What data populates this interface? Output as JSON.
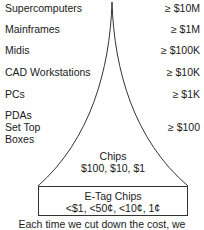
{
  "tiers": [
    {
      "name": "Supercomputers",
      "price": "≥ $10M"
    },
    {
      "name": "Mainframes",
      "price": "≥ $1M"
    },
    {
      "name": "Midis",
      "price": "≥ $100K"
    },
    {
      "name": "CAD Workstations",
      "price": "≥ $10K"
    },
    {
      "name": "PCs",
      "price": "≥ $1K"
    },
    {
      "name_lines": [
        "PDAs",
        "Set Top",
        "Boxes"
      ],
      "price": "≥ $100"
    }
  ],
  "chips": {
    "title": "Chips",
    "prices": "$100, $10, $1"
  },
  "etag": {
    "title": "E-Tag Chips",
    "prices": "<$1, <50¢, <10¢, 1¢"
  },
  "caption_lines": [
    "Each time we cut down the cost, we",
    "increase by more than order of"
  ]
}
